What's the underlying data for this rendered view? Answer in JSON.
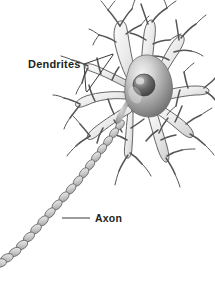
{
  "figure": {
    "background_color": "#ffffff",
    "style": "grayscale pencil-shaded anatomical illustration"
  },
  "labels": [
    {
      "id": "dendrites",
      "text": "Dendrites",
      "x": 28,
      "y": 66,
      "leader": "bracket pointing right to two dendrite branches",
      "color": "#231f20"
    },
    {
      "id": "axon",
      "text": "Axon",
      "x": 95,
      "y": 222,
      "leader": "horizontal line pointing left to myelinated axon",
      "color": "#231f20"
    }
  ],
  "parts": {
    "soma": {
      "name": "cell body (soma)",
      "center_x": 146,
      "center_y": 96,
      "fill_light": "#e9e9e9",
      "fill_dark": "#6e6e6e",
      "outline": "#6b6b6b"
    },
    "nucleus": {
      "name": "nucleus",
      "center_x": 144,
      "center_y": 85,
      "radius": 11,
      "fill_light": "#bdbdbd",
      "fill_dark": "#4a4a4a",
      "nucleolus": "light highlight upper-left"
    },
    "dendrites": {
      "name": "dendrites",
      "count": 9,
      "description": "branching tapered processes radiating from the soma, each splitting into finer twigs",
      "fill": "#f1f1f1",
      "outline": "#4a4a4a"
    },
    "axon": {
      "name": "axon",
      "description": "long myelinated fiber leaving the lower-left of the soma and running to the bottom-left corner",
      "segment_count": 18,
      "fill_light": "#e2e2e2",
      "fill_dark": "#9a9a9a",
      "outline": "#5a5a5a"
    }
  }
}
